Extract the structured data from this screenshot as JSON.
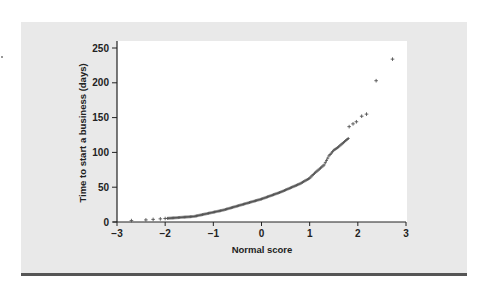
{
  "figure": {
    "panel_color": "#e9e9e9",
    "plot_bg": "#ffffff",
    "rule_color": "#555555",
    "point_color": "#555555"
  },
  "chart_data": {
    "type": "scatter",
    "title": "",
    "xlabel": "Normal score",
    "ylabel": "Time to start a business (days)",
    "xlim": [
      -3,
      3
    ],
    "ylim": [
      0,
      250
    ],
    "xticks": [
      -3,
      -2,
      -1,
      0,
      1,
      2,
      3
    ],
    "xtick_labels": [
      "−3",
      "−2",
      "−1",
      "0",
      "1",
      "2",
      "3"
    ],
    "yticks": [
      0,
      50,
      100,
      150,
      200,
      250
    ],
    "ytick_labels": [
      "0",
      "50",
      "100",
      "150",
      "200",
      "250"
    ],
    "grid": false,
    "legend": null,
    "marker": "+",
    "curve_anchors": {
      "x": [
        -2.7,
        -2.4,
        -2.2,
        -2.0,
        -1.8,
        -1.6,
        -1.4,
        -1.2,
        -1.0,
        -0.8,
        -0.6,
        -0.4,
        -0.2,
        0.0,
        0.2,
        0.4,
        0.6,
        0.8,
        1.0,
        1.1,
        1.2,
        1.3,
        1.4,
        1.5,
        1.6,
        1.7,
        1.8
      ],
      "y": [
        2,
        3,
        4,
        5,
        6,
        7,
        8,
        11,
        14,
        17,
        21,
        25,
        29,
        33,
        38,
        43,
        49,
        55,
        63,
        70,
        76,
        82,
        95,
        103,
        108,
        114,
        120
      ]
    },
    "tail_points": {
      "x": [
        1.82,
        1.9,
        1.97,
        2.08,
        2.18,
        2.38,
        2.72
      ],
      "y": [
        137,
        141,
        144,
        152,
        155,
        203,
        234
      ]
    }
  }
}
